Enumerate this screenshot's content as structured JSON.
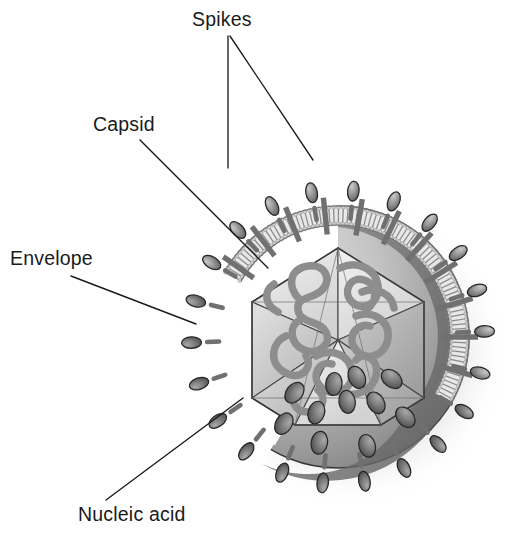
{
  "figure": {
    "background_color": "#ffffff",
    "width": 524,
    "height": 545
  },
  "labels": [
    {
      "id": "spikes",
      "text": "Spikes",
      "x": 192,
      "y": 26,
      "anchor": "start",
      "leaders": [
        {
          "points": "228,36 228,168"
        },
        {
          "points": "230,36 313,160"
        }
      ]
    },
    {
      "id": "capsid",
      "text": "Capsid",
      "x": 93,
      "y": 131,
      "anchor": "start",
      "leaders": [
        {
          "points": "140,140 268,268"
        }
      ]
    },
    {
      "id": "envelope",
      "text": "Envelope",
      "x": 10,
      "y": 265,
      "anchor": "start",
      "leaders": [
        {
          "points": "71,276 196,324"
        }
      ]
    },
    {
      "id": "nucleic-acid",
      "text": "Nucleic acid",
      "x": 78,
      "y": 521,
      "anchor": "start",
      "leaders": [
        {
          "points": "106,500 243,398"
        }
      ]
    }
  ],
  "virion": {
    "center_x": 338,
    "center_y": 337,
    "outer_radius": 152,
    "envelope_outer_radius": 131,
    "envelope_inner_radius": 112,
    "capsid_radius": 86,
    "cutaway_start_deg": 300,
    "cutaway_end_deg": 120,
    "colors": {
      "outline": "#2b2b2b",
      "dome_light": "#c9c9c9",
      "dome_dark": "#6e6e6e",
      "dome_mid": "#9a9a9a",
      "spike_light": "#b4b4b4",
      "spike_dark": "#5c5c5c",
      "spike_outline": "#262626",
      "bilayer_fill": "#e8e8e8",
      "bilayer_line": "#8a8a8a",
      "bilayer_head": "#cfcfcf",
      "membrane_protein": "#707070",
      "capsid_light": "#ededed",
      "capsid_mid": "#cdcdcd",
      "capsid_dark": "#a6a6a6",
      "capsid_edge": "#4a4a4a",
      "nucleic_acid": "#8f8f8f",
      "shadow": "#d8d8d8"
    }
  },
  "structures": {
    "spikes": {
      "name": "Spikes",
      "description": "Glycoprotein projections on the envelope surface",
      "count_visible": 34,
      "shape": "ellipse-on-stalk"
    },
    "envelope": {
      "name": "Envelope",
      "description": "Lipid bilayer membrane",
      "shape": "phospholipid-bilayer"
    },
    "capsid": {
      "name": "Capsid",
      "description": "Icosahedral protein shell",
      "shape": "icosahedron",
      "faces_visible": 7
    },
    "nucleic_acid": {
      "name": "Nucleic acid",
      "description": "Coiled genome within the capsid",
      "shape": "coiled-strand"
    }
  }
}
